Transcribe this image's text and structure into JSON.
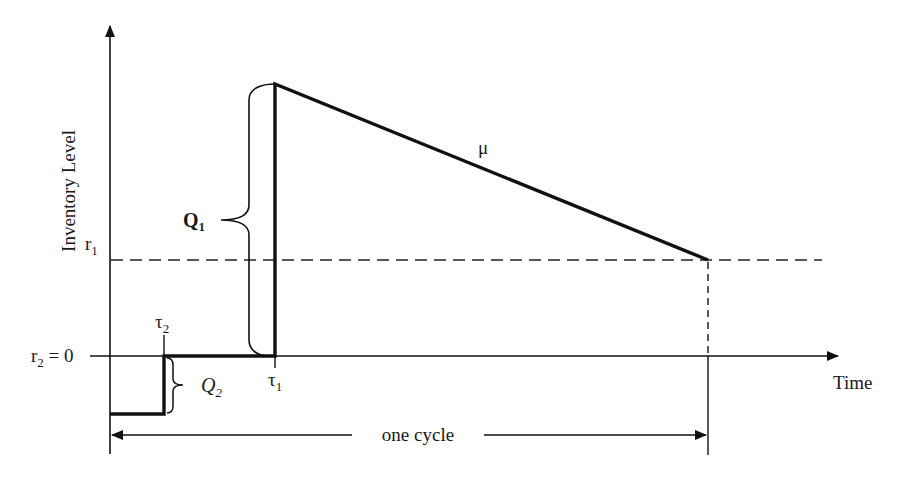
{
  "diagram": {
    "axes": {
      "y_label": "Inventory Level",
      "x_label": "Time"
    },
    "levels": {
      "r1": {
        "base": "r",
        "sub": "1"
      },
      "r2": {
        "base": "r",
        "sub": "2",
        "suffix": " = 0"
      }
    },
    "quantities": {
      "Q1": {
        "base": "Q",
        "sub": "1"
      },
      "Q2": {
        "base": "Q",
        "sub": "2"
      }
    },
    "times": {
      "tau1": {
        "base": "τ",
        "sub": "1"
      },
      "tau2": {
        "base": "τ",
        "sub": "2"
      }
    },
    "rate_label": "μ",
    "cycle_label": "one cycle",
    "colors": {
      "line": "#111111",
      "text": "#1a1a1a",
      "background": "#ffffff"
    }
  }
}
